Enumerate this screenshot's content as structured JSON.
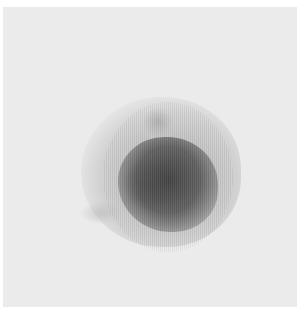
{
  "image": {
    "description": "Grayscale nuclear medicine scintigraphy scan showing a dark, roughly rounded uptake region near center on a light gray field",
    "colors": {
      "page_background": "#ffffff",
      "field": "#ebebeb",
      "core": "#3c3c3c",
      "halo": "#a0a0a0"
    }
  }
}
